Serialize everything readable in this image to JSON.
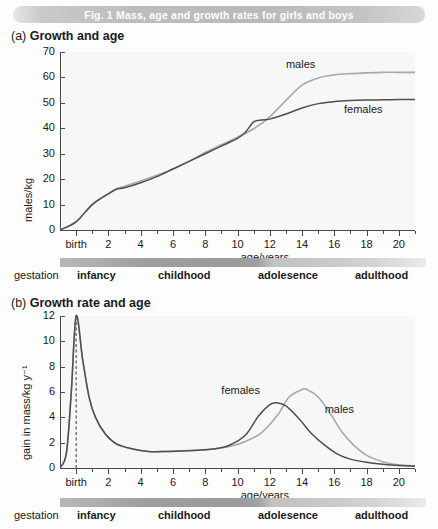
{
  "figure": {
    "title": "Fig. 1  Mass, age and growth rates for girls and boys"
  },
  "panel_a": {
    "prefix": "(a)",
    "heading": "Growth and age"
  },
  "panel_b": {
    "prefix": "(b)",
    "heading": "Growth rate and age"
  },
  "stages": {
    "labels": [
      "gestation",
      "infancy",
      "childhood",
      "adolesence",
      "adulthood"
    ],
    "bold": [
      false,
      true,
      true,
      true,
      true
    ]
  },
  "chart_data": [
    {
      "id": "a",
      "type": "line",
      "title": "Growth and age",
      "xlabel": "age/years",
      "ylabel": "males/kg",
      "xlim": [
        -1,
        21
      ],
      "ylim": [
        0,
        70
      ],
      "yticks": [
        0,
        10,
        20,
        30,
        40,
        50,
        60,
        70
      ],
      "xticks_major": [
        "birth",
        "2",
        "4",
        "6",
        "8",
        "10",
        "12",
        "14",
        "16",
        "18",
        "20"
      ],
      "xticks_major_values": [
        0,
        2,
        4,
        6,
        8,
        10,
        12,
        14,
        16,
        18,
        20
      ],
      "xticks_minor_values": [
        1,
        3,
        5,
        7,
        9,
        11,
        13,
        15,
        17,
        19,
        21
      ],
      "grid": false,
      "legend_position": "inline-annotations",
      "series": [
        {
          "name": "males",
          "color": "#a9a9a9",
          "x": [
            -1,
            0,
            1,
            2,
            2.5,
            3,
            4,
            5,
            6,
            7,
            8,
            9,
            10,
            11,
            12,
            13,
            14,
            15,
            16,
            17,
            18,
            19,
            20,
            21
          ],
          "values": [
            0,
            3.4,
            10.0,
            14.3,
            16.2,
            17.2,
            19.3,
            21.5,
            24.0,
            27.0,
            30.5,
            33.5,
            36.5,
            39.8,
            44.5,
            51.0,
            57.0,
            59.8,
            61.0,
            61.5,
            61.8,
            62.0,
            62.0,
            62.0
          ]
        },
        {
          "name": "females",
          "color": "#4f4f4f",
          "x": [
            -1,
            0,
            1,
            2,
            2.5,
            3,
            4,
            5,
            6,
            7,
            8,
            9,
            10,
            10.5,
            11,
            11.5,
            12,
            13,
            14,
            15,
            16,
            17,
            18,
            19,
            20,
            21
          ],
          "values": [
            0,
            3.2,
            10.0,
            14.2,
            16.0,
            16.6,
            18.6,
            21.0,
            24.0,
            27.0,
            30.0,
            33.0,
            36.0,
            38.5,
            42.5,
            43.3,
            43.6,
            45.6,
            48.0,
            49.7,
            50.5,
            50.9,
            51.1,
            51.2,
            51.3,
            51.3
          ]
        }
      ],
      "annotations": [
        {
          "text": "males",
          "x": 13.0,
          "y": 65.0
        },
        {
          "text": "females",
          "x": 16.6,
          "y": 47.0
        }
      ]
    },
    {
      "id": "b",
      "type": "line",
      "title": "Growth rate and age",
      "xlabel": "age/years",
      "ylabel": "gain in mass/kg y⁻¹",
      "xlim": [
        -1,
        21
      ],
      "ylim": [
        0,
        12
      ],
      "yticks": [
        0,
        2,
        4,
        6,
        8,
        10,
        12
      ],
      "xticks_major": [
        "birth",
        "2",
        "4",
        "6",
        "8",
        "10",
        "12",
        "14",
        "16",
        "18",
        "20"
      ],
      "xticks_major_values": [
        0,
        2,
        4,
        6,
        8,
        10,
        12,
        14,
        16,
        18,
        20
      ],
      "xticks_minor_values": [
        1,
        3,
        5,
        7,
        9,
        11,
        13,
        15,
        17,
        19,
        21
      ],
      "grid": false,
      "birth_line": {
        "x": 0,
        "style": "dashed",
        "from_y": 0,
        "to_y": 12
      },
      "legend_position": "inline-annotations",
      "series": [
        {
          "name": "males",
          "color": "#a9a9a9",
          "x": [
            -1,
            -0.6,
            -0.3,
            0,
            0.4,
            0.8,
            1.2,
            1.8,
            2.5,
            3.5,
            4.5,
            5.5,
            6.5,
            7.5,
            8.5,
            9.5,
            10.5,
            11.5,
            12.5,
            13.2,
            14.0,
            14.3,
            15.0,
            15.8,
            16.5,
            17.2,
            18.0,
            19.0,
            20.0,
            21.0
          ],
          "values": [
            0.0,
            1.2,
            6.0,
            12.0,
            8.6,
            5.6,
            4.0,
            2.7,
            1.9,
            1.5,
            1.3,
            1.3,
            1.35,
            1.4,
            1.5,
            1.7,
            2.1,
            2.8,
            4.2,
            5.6,
            6.2,
            6.2,
            5.6,
            4.2,
            2.8,
            1.8,
            1.0,
            0.5,
            0.25,
            0.15
          ]
        },
        {
          "name": "females",
          "color": "#4f4f4f",
          "x": [
            -1,
            -0.6,
            -0.3,
            0,
            0.4,
            0.8,
            1.2,
            1.8,
            2.5,
            3.5,
            4.5,
            5.5,
            6.5,
            7.5,
            8.5,
            9.5,
            10.5,
            11.3,
            12.0,
            12.4,
            13.0,
            13.8,
            14.6,
            15.4,
            16.2,
            17.0,
            18.0,
            19.0,
            20.0,
            21.0
          ],
          "values": [
            0.0,
            1.2,
            6.0,
            12.0,
            8.6,
            5.6,
            4.0,
            2.7,
            1.9,
            1.5,
            1.3,
            1.3,
            1.35,
            1.4,
            1.5,
            1.8,
            2.6,
            4.1,
            5.0,
            5.15,
            4.9,
            3.9,
            2.7,
            1.8,
            1.1,
            0.7,
            0.45,
            0.3,
            0.2,
            0.15
          ]
        }
      ],
      "annotations": [
        {
          "text": "females",
          "x": 9.0,
          "y": 6.1
        },
        {
          "text": "males",
          "x": 15.4,
          "y": 4.6
        }
      ]
    }
  ]
}
